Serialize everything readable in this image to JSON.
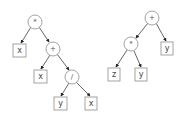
{
  "diagram": {
    "type": "expression-trees",
    "trees": [
      {
        "name": "left-tree",
        "root": "*",
        "nodes": {
          "n1": {
            "label": "*",
            "kind": "operator"
          },
          "n2": {
            "label": "x",
            "kind": "operand"
          },
          "n3": {
            "label": "+",
            "kind": "operator"
          },
          "n4": {
            "label": "x",
            "kind": "operand"
          },
          "n5": {
            "label": "/",
            "kind": "operator"
          },
          "n6": {
            "label": "y",
            "kind": "operand"
          },
          "n7": {
            "label": "x",
            "kind": "operand"
          }
        },
        "edges": [
          [
            "n1",
            "n2"
          ],
          [
            "n1",
            "n3"
          ],
          [
            "n3",
            "n4"
          ],
          [
            "n3",
            "n5"
          ],
          [
            "n5",
            "n6"
          ],
          [
            "n5",
            "n7"
          ]
        ]
      },
      {
        "name": "right-tree",
        "root": "+",
        "nodes": {
          "m1": {
            "label": "+",
            "kind": "operator"
          },
          "m2": {
            "label": "*",
            "kind": "operator"
          },
          "m3": {
            "label": "y",
            "kind": "operand"
          },
          "m4": {
            "label": "z",
            "kind": "operand"
          },
          "m5": {
            "label": "y",
            "kind": "operand"
          }
        },
        "edges": [
          [
            "m1",
            "m2"
          ],
          [
            "m1",
            "m3"
          ],
          [
            "m2",
            "m4"
          ],
          [
            "m2",
            "m5"
          ]
        ]
      }
    ]
  },
  "L": {
    "n1": "*",
    "n2": "x",
    "n3": "+",
    "n4": "x",
    "n5": "/",
    "n6": "y",
    "n7": "x"
  },
  "R": {
    "m1": "+",
    "m2": "*",
    "m3": "y",
    "m4": "z",
    "m5": "y"
  }
}
